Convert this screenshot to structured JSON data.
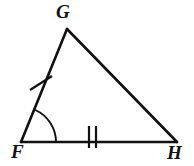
{
  "figure": {
    "name": "triangle-fgh",
    "kind": "geometry-diagram",
    "background_color": "#ffffff",
    "stroke_color": "#111111",
    "canvas": {
      "width": 194,
      "height": 166
    }
  },
  "labels": {
    "G": "G",
    "F": "F",
    "H": "H"
  },
  "vertices": [
    {
      "id": "G",
      "label": "G",
      "x": 67,
      "y": 29
    },
    {
      "id": "F",
      "label": "F",
      "x": 21,
      "y": 142
    },
    {
      "id": "H",
      "label": "H",
      "x": 177,
      "y": 142
    }
  ],
  "sides": [
    {
      "id": "FG",
      "from": "F",
      "to": "G",
      "tick_marks": 1,
      "tick_style": "slash"
    },
    {
      "id": "GH",
      "from": "G",
      "to": "H",
      "tick_marks": 0,
      "tick_style": "none"
    },
    {
      "id": "FH",
      "from": "F",
      "to": "H",
      "tick_marks": 2,
      "tick_style": "vertical"
    }
  ],
  "marks": {
    "single_tick": {
      "name": "tick-mark-fg",
      "on_side": "FG",
      "x1": 30,
      "y1": 90,
      "x2": 52,
      "y2": 76
    },
    "double_tick": {
      "name": "tick-marks-fh",
      "on_side": "FH",
      "bars": [
        {
          "x": 89,
          "y1": 126,
          "y2": 148
        },
        {
          "x": 96,
          "y1": 126,
          "y2": 148
        }
      ]
    },
    "angle_arc": {
      "name": "angle-arc-f",
      "at_vertex": "F",
      "radius": 35,
      "path": "M 35.3 110.0 A 35 35 0 0 1 56 142"
    }
  },
  "stroke_widths": {
    "triangle": 2.6,
    "tick": 2.2,
    "arc": 1.9
  }
}
